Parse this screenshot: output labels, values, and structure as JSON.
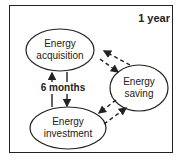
{
  "diagram": {
    "period_label": "1 year",
    "inner_period_label": "6 months",
    "nodes": [
      {
        "id": "acquisition",
        "line1": "Energy",
        "line2": "acquisition"
      },
      {
        "id": "saving",
        "line1": "Energy",
        "line2": "saving"
      },
      {
        "id": "investment",
        "line1": "Energy",
        "line2": "investment"
      }
    ],
    "edges": [
      {
        "from": "investment",
        "to": "acquisition",
        "style": "solid"
      },
      {
        "from": "acquisition",
        "to": "investment",
        "style": "solid"
      },
      {
        "from": "acquisition",
        "to": "saving",
        "style": "dashed"
      },
      {
        "from": "saving",
        "to": "acquisition",
        "style": "dashed"
      },
      {
        "from": "saving",
        "to": "investment",
        "style": "dashed"
      },
      {
        "from": "investment",
        "to": "saving",
        "style": "dashed"
      }
    ],
    "colors": {
      "stroke": "#222222",
      "background": "#ffffff"
    }
  }
}
